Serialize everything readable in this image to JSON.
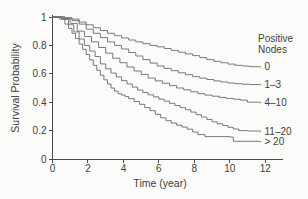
{
  "figure": {
    "background": "#fbfbf9",
    "text_color": "#3f3f3f",
    "axis_color": "#4a4a4a",
    "curve_color": "#6b6b6b"
  },
  "chart_data": {
    "type": "line",
    "subtype": "kaplan-meier-step-curves",
    "title": "",
    "xlabel": "Time (year)",
    "ylabel": "Survival Probability",
    "xlim": [
      0,
      12
    ],
    "ylim": [
      0,
      1
    ],
    "xticks": [
      0,
      2,
      4,
      6,
      8,
      10,
      12
    ],
    "xtick_labels": [
      "0",
      "2",
      "4",
      "6",
      "8",
      "10",
      "12"
    ],
    "yticks": [
      0,
      0.2,
      0.4,
      0.6,
      0.8,
      1
    ],
    "ytick_labels": [
      "0",
      "0.2",
      "0.4",
      "0.6",
      "0.8",
      "1"
    ],
    "grid": false,
    "legend_title_lines": [
      "Positive",
      "Nodes"
    ],
    "legend_position": "right of curve ends",
    "series": [
      {
        "label": "0",
        "name": "nodes-0",
        "end_value": 0.65,
        "points": [
          [
            0,
            1
          ],
          [
            0.7,
            0.995
          ],
          [
            1.1,
            0.985
          ],
          [
            1.5,
            0.965
          ],
          [
            1.9,
            0.945
          ],
          [
            2.3,
            0.925
          ],
          [
            2.7,
            0.905
          ],
          [
            3.1,
            0.885
          ],
          [
            3.5,
            0.868
          ],
          [
            3.9,
            0.852
          ],
          [
            4.3,
            0.838
          ],
          [
            4.7,
            0.825
          ],
          [
            5.1,
            0.812
          ],
          [
            5.5,
            0.8
          ],
          [
            5.9,
            0.79
          ],
          [
            6.3,
            0.778
          ],
          [
            6.7,
            0.765
          ],
          [
            7.1,
            0.752
          ],
          [
            7.5,
            0.74
          ],
          [
            7.9,
            0.728
          ],
          [
            8.3,
            0.714
          ],
          [
            8.7,
            0.7
          ],
          [
            9.1,
            0.688
          ],
          [
            9.5,
            0.678
          ],
          [
            9.9,
            0.668
          ],
          [
            10.3,
            0.66
          ],
          [
            10.7,
            0.655
          ],
          [
            11.1,
            0.65
          ],
          [
            11.7,
            0.648
          ]
        ]
      },
      {
        "label": "1–3",
        "name": "nodes-1-3",
        "end_value": 0.52,
        "points": [
          [
            0,
            1
          ],
          [
            0.7,
            0.99
          ],
          [
            1.1,
            0.975
          ],
          [
            1.5,
            0.95
          ],
          [
            1.9,
            0.915
          ],
          [
            2.3,
            0.885
          ],
          [
            2.7,
            0.855
          ],
          [
            3.1,
            0.825
          ],
          [
            3.5,
            0.8
          ],
          [
            3.9,
            0.775
          ],
          [
            4.3,
            0.75
          ],
          [
            4.7,
            0.725
          ],
          [
            5.1,
            0.7
          ],
          [
            5.5,
            0.675
          ],
          [
            5.9,
            0.655
          ],
          [
            6.3,
            0.638
          ],
          [
            6.7,
            0.622
          ],
          [
            7.1,
            0.607
          ],
          [
            7.5,
            0.594
          ],
          [
            7.9,
            0.58
          ],
          [
            8.3,
            0.57
          ],
          [
            8.7,
            0.56
          ],
          [
            9.1,
            0.55
          ],
          [
            9.5,
            0.542
          ],
          [
            9.9,
            0.535
          ],
          [
            10.3,
            0.53
          ],
          [
            10.7,
            0.527
          ],
          [
            11.1,
            0.525
          ],
          [
            11.7,
            0.523
          ]
        ]
      },
      {
        "label": "4–10",
        "name": "nodes-4-10",
        "end_value": 0.4,
        "points": [
          [
            0,
            1
          ],
          [
            0.6,
            0.985
          ],
          [
            1,
            0.955
          ],
          [
            1.4,
            0.9
          ],
          [
            1.8,
            0.862
          ],
          [
            2.2,
            0.825
          ],
          [
            2.6,
            0.785
          ],
          [
            3,
            0.745
          ],
          [
            3.4,
            0.71
          ],
          [
            3.8,
            0.678
          ],
          [
            4.2,
            0.648
          ],
          [
            4.6,
            0.62
          ],
          [
            5,
            0.595
          ],
          [
            5.4,
            0.57
          ],
          [
            5.8,
            0.55
          ],
          [
            6.2,
            0.533
          ],
          [
            6.6,
            0.517
          ],
          [
            7,
            0.5
          ],
          [
            7.4,
            0.487
          ],
          [
            7.8,
            0.473
          ],
          [
            8.2,
            0.46
          ],
          [
            8.6,
            0.45
          ],
          [
            9,
            0.442
          ],
          [
            9.4,
            0.434
          ],
          [
            9.8,
            0.427
          ],
          [
            10.2,
            0.421
          ],
          [
            10.6,
            0.415
          ],
          [
            11,
            0.4
          ],
          [
            11.7,
            0.395
          ]
        ]
      },
      {
        "label": "11–20",
        "name": "nodes-11-20",
        "end_value": 0.2,
        "points": [
          [
            0,
            1
          ],
          [
            0.5,
            0.985
          ],
          [
            0.9,
            0.945
          ],
          [
            1.2,
            0.895
          ],
          [
            1.5,
            0.845
          ],
          [
            1.8,
            0.8
          ],
          [
            2.1,
            0.76
          ],
          [
            2.4,
            0.722
          ],
          [
            2.7,
            0.67
          ],
          [
            3,
            0.635
          ],
          [
            3.3,
            0.605
          ],
          [
            3.6,
            0.578
          ],
          [
            3.9,
            0.552
          ],
          [
            4.2,
            0.528
          ],
          [
            4.5,
            0.506
          ],
          [
            4.8,
            0.486
          ],
          [
            5.1,
            0.468
          ],
          [
            5.4,
            0.452
          ],
          [
            5.7,
            0.437
          ],
          [
            6,
            0.422
          ],
          [
            6.3,
            0.407
          ],
          [
            6.6,
            0.392
          ],
          [
            6.9,
            0.377
          ],
          [
            7.2,
            0.362
          ],
          [
            7.5,
            0.347
          ],
          [
            7.8,
            0.33
          ],
          [
            8.1,
            0.312
          ],
          [
            8.4,
            0.295
          ],
          [
            8.7,
            0.278
          ],
          [
            9,
            0.262
          ],
          [
            9.3,
            0.248
          ],
          [
            9.6,
            0.235
          ],
          [
            9.9,
            0.223
          ],
          [
            10.2,
            0.211
          ],
          [
            10.5,
            0.2
          ],
          [
            11,
            0.197
          ],
          [
            11.7,
            0.195
          ]
        ]
      },
      {
        "label": "> 20",
        "name": "nodes-gt-20",
        "end_value": 0.12,
        "points": [
          [
            0,
            1
          ],
          [
            0.4,
            0.985
          ],
          [
            0.7,
            0.95
          ],
          [
            0.9,
            0.92
          ],
          [
            1.1,
            0.885
          ],
          [
            1.3,
            0.848
          ],
          [
            1.5,
            0.81
          ],
          [
            1.7,
            0.772
          ],
          [
            1.9,
            0.735
          ],
          [
            2.1,
            0.698
          ],
          [
            2.3,
            0.66
          ],
          [
            2.5,
            0.625
          ],
          [
            2.7,
            0.59
          ],
          [
            2.9,
            0.558
          ],
          [
            3.1,
            0.528
          ],
          [
            3.3,
            0.5
          ],
          [
            3.5,
            0.478
          ],
          [
            3.7,
            0.46
          ],
          [
            3.9,
            0.45
          ],
          [
            4.1,
            0.44
          ],
          [
            4.3,
            0.425
          ],
          [
            4.6,
            0.405
          ],
          [
            4.9,
            0.385
          ],
          [
            5.2,
            0.362
          ],
          [
            5.5,
            0.34
          ],
          [
            5.8,
            0.315
          ],
          [
            6.1,
            0.29
          ],
          [
            6.4,
            0.27
          ],
          [
            6.7,
            0.253
          ],
          [
            7,
            0.238
          ],
          [
            7.3,
            0.225
          ],
          [
            7.6,
            0.21
          ],
          [
            7.9,
            0.19
          ],
          [
            8.2,
            0.172
          ],
          [
            8.6,
            0.158
          ],
          [
            10,
            0.155
          ],
          [
            10.2,
            0.125
          ],
          [
            11.7,
            0.122
          ]
        ]
      }
    ]
  }
}
